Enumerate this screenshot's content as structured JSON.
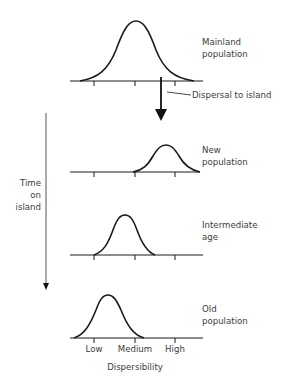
{
  "diagram": {
    "panels": [
      {
        "id": "mainland",
        "label_line1": "Mainland",
        "label_line2": "population"
      },
      {
        "id": "new",
        "label_line1": "New",
        "label_line2": "population"
      },
      {
        "id": "intermediate",
        "label_line1": "Intermediate",
        "label_line2": "age"
      },
      {
        "id": "old",
        "label_line1": "Old",
        "label_line2": "population"
      }
    ],
    "dispersal_label": "Dispersal to island",
    "time_axis": {
      "line1": "Time",
      "line2": "on",
      "line3": "island"
    },
    "x_axis": {
      "ticks": [
        "Low",
        "Medium",
        "High"
      ],
      "title": "Dispersibility"
    },
    "colors": {
      "stroke": "#1a1a1a",
      "text": "#3c3c3c",
      "background": "#ffffff"
    }
  }
}
